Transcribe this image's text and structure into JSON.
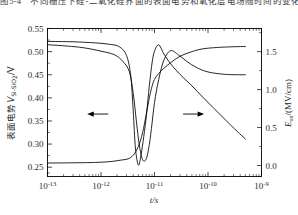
{
  "figure": {
    "caption_top": "图5-4　不同栅压下硅-二氧化硅界面的表面电势和氧化层电场随时间的变化"
  },
  "chart_data": {
    "type": "line",
    "title": "",
    "xlabel": "t/s",
    "ylabel_left": "表面电势 V_Si-SiO2 /V",
    "ylabel_right": "E_ox/(MV/cm)",
    "x_scale": "log",
    "xlim": [
      1e-13,
      1e-09
    ],
    "xticks": [
      1e-13,
      1e-12,
      1e-11,
      1e-10,
      1e-09
    ],
    "xtick_labels": [
      "10^-13",
      "10^-12",
      "10^-11",
      "10^-10",
      "10^-9"
    ],
    "xtick_mantissa": "10",
    "xtick_exponents": [
      "-13",
      "-12",
      "-11",
      "-10",
      "-9"
    ],
    "ylim_left": [
      0.2299,
      0.55
    ],
    "yticks_left": [
      0.25,
      0.3,
      0.35,
      0.4,
      0.45,
      0.5,
      0.55
    ],
    "ytick_labels_left": [
      "0.25",
      "0.30",
      "0.35",
      "0.40",
      "0.45",
      "0.50",
      "0.55"
    ],
    "ylim_right": [
      -0.145,
      1.805
    ],
    "yticks_right": [
      0.0,
      0.5,
      1.0,
      1.5
    ],
    "ytick_labels_right": [
      "0.0",
      "0.5",
      "1.0",
      "1.5"
    ],
    "grid": false,
    "legend": "none",
    "annotations": [
      {
        "name": "left-arrow",
        "text": "←",
        "x": 8.5e-13,
        "y_left": 0.365,
        "points_to": "left-axis"
      },
      {
        "name": "right-arrow",
        "text": "→",
        "x": 5.5e-11,
        "y_left": 0.365,
        "points_to": "right-axis"
      }
    ],
    "series": [
      {
        "name": "表面电势 V_Si-SiO2",
        "axis": "left",
        "unit": "V",
        "x": [
          1e-13,
          1.6e-13,
          3e-13,
          6e-13,
          1e-12,
          1.6e-12,
          2.4e-12,
          3.2e-12,
          4e-12,
          5e-12,
          6e-12,
          7e-12,
          8e-12,
          9e-12,
          1e-11,
          1.2e-11,
          1.5e-11,
          2e-11,
          3e-11,
          5e-11,
          8e-11,
          1.5e-10,
          3e-10,
          5e-10
        ],
        "y": [
          0.259,
          0.2592,
          0.2595,
          0.26,
          0.2608,
          0.2625,
          0.2655,
          0.268,
          0.276,
          0.295,
          0.325,
          0.364,
          0.4,
          0.425,
          0.44,
          0.453,
          0.464,
          0.476,
          0.49,
          0.5,
          0.506,
          0.509,
          0.5105,
          0.511
        ]
      },
      {
        "name": "E_ox",
        "axis": "right",
        "unit": "MV/cm",
        "x": [
          1e-13,
          3e-13,
          8e-13,
          1.5e-12,
          2.2e-12,
          3e-12,
          3.6e-12,
          4e-12,
          4.4e-12,
          5e-12,
          5.6e-12,
          6.3e-12,
          7.1e-12,
          8e-12,
          9e-12,
          1e-11,
          1.2e-11,
          1.5e-11,
          2e-11,
          3e-11,
          5e-11,
          8e-11,
          1.3e-10,
          2.2e-10,
          3.5e-10,
          5e-10
        ],
        "y": [
          1.635,
          1.63,
          1.615,
          1.595,
          1.565,
          1.45,
          1.18,
          0.72,
          0.23,
          0.005,
          0.14,
          0.38,
          0.68,
          1.05,
          1.35,
          1.505,
          1.59,
          1.47,
          1.34,
          1.2,
          1.05,
          0.9,
          0.75,
          0.59,
          0.45,
          0.35
        ]
      },
      {
        "name": "表面电势 高栅压分支",
        "axis": "left",
        "unit": "V",
        "x": [
          1e-13,
          4e-13,
          1e-12,
          1.8e-12,
          2.6e-12,
          3.4e-12,
          4e-12,
          4.6e-12,
          5.2e-12,
          6e-12,
          7e-12,
          8e-12,
          9e-12,
          1e-11,
          1.2e-11,
          1.5e-11,
          2e-11,
          2.8e-11,
          4e-11,
          6e-11,
          1e-10,
          2e-10,
          3.5e-10,
          5e-10
        ],
        "y": [
          0.515,
          0.5095,
          0.501,
          0.493,
          0.478,
          0.456,
          0.41,
          0.348,
          0.298,
          0.266,
          0.268,
          0.299,
          0.345,
          0.39,
          0.44,
          0.482,
          0.502,
          0.493,
          0.479,
          0.466,
          0.456,
          0.451,
          0.45,
          0.45
        ]
      }
    ]
  }
}
